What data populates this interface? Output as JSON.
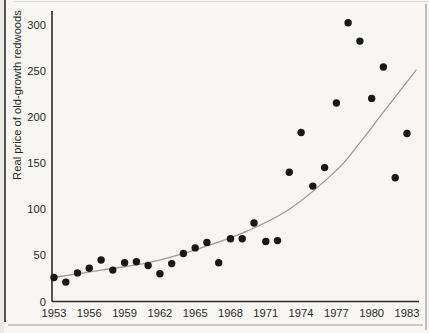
{
  "figure": {
    "y_axis_title": "Real price of old-growth redwoods"
  },
  "colors": {
    "background": "#f7f6f2",
    "point": "#181818",
    "curve": "#9c9c98",
    "axis": "#2b2a28",
    "text": "#2b2a28"
  },
  "chart_data": {
    "type": "scatter",
    "title": "",
    "xlabel": "",
    "ylabel": "Real price of old-growth redwoods",
    "xlim": [
      1953,
      1984.2
    ],
    "ylim": [
      0,
      310
    ],
    "grid": false,
    "legend": "none",
    "x_tick_labels": [
      1953,
      1956,
      1959,
      1962,
      1965,
      1968,
      1971,
      1974,
      1977,
      1980,
      1983
    ],
    "y_tick_labels": [
      0,
      50,
      100,
      150,
      200,
      250,
      300
    ],
    "x": [
      1953,
      1954,
      1955,
      1956,
      1957,
      1958,
      1959,
      1960,
      1961,
      1962,
      1963,
      1964,
      1965,
      1966,
      1967,
      1968,
      1969,
      1970,
      1971,
      1972,
      1973,
      1974,
      1975,
      1976,
      1977,
      1978,
      1979,
      1980,
      1981,
      1982,
      1983
    ],
    "y": [
      26,
      21,
      31,
      36,
      45,
      34,
      42,
      43,
      39,
      30,
      41,
      52,
      58,
      64,
      42,
      68,
      68,
      85,
      65,
      66,
      140,
      183,
      125,
      145,
      215,
      302,
      282,
      220,
      254,
      134,
      182
    ],
    "series_name": "Real price of old-growth redwoods",
    "trend_curve": {
      "style": "smooth exponential fit",
      "x_years": [
        1953,
        1957,
        1961,
        1965,
        1969,
        1973,
        1977,
        1979,
        1981,
        1983.8
      ],
      "values": [
        26,
        34,
        42,
        56,
        74,
        100,
        142,
        172,
        205,
        251
      ]
    }
  }
}
